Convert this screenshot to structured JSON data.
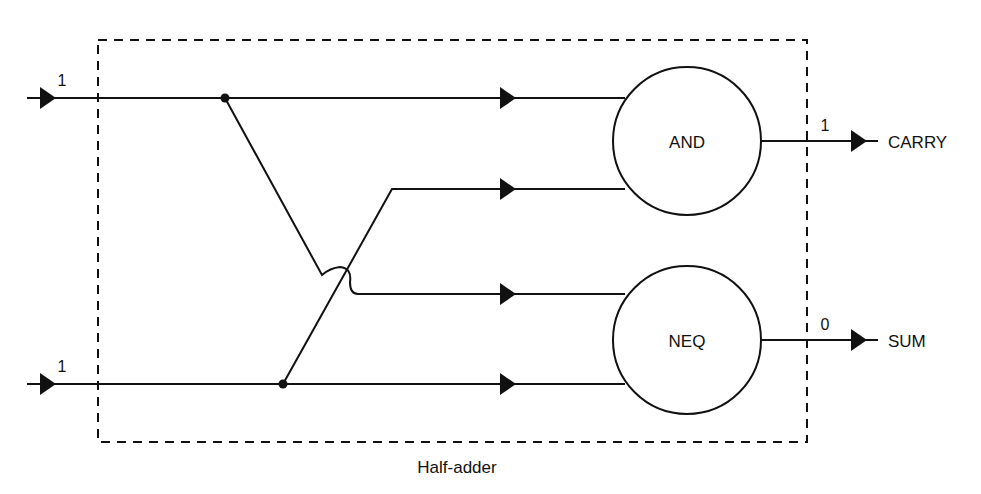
{
  "diagram": {
    "caption": "Half-adder",
    "inputs": [
      {
        "id": "input-a",
        "value": "1"
      },
      {
        "id": "input-b",
        "value": "1"
      }
    ],
    "gates": [
      {
        "id": "and",
        "label": "AND"
      },
      {
        "id": "neq",
        "label": "NEQ"
      }
    ],
    "outputs": [
      {
        "id": "carry",
        "label": "CARRY",
        "value": "1"
      },
      {
        "id": "sum",
        "label": "SUM",
        "value": "0"
      }
    ],
    "colors": {
      "line": "#111111",
      "background": "#ffffff"
    }
  }
}
